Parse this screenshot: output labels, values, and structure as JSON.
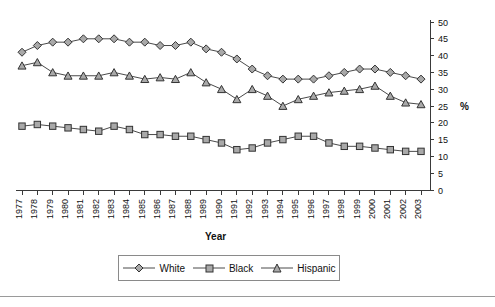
{
  "chart_data": {
    "type": "line",
    "title": "",
    "xlabel": "Year",
    "ylabel": "%",
    "ylim": [
      0,
      50
    ],
    "yticks": [
      0,
      5,
      10,
      15,
      20,
      25,
      30,
      35,
      40,
      45,
      50
    ],
    "grid": false,
    "legend_position": "bottom",
    "categories": [
      "1977",
      "1978",
      "1979",
      "1980",
      "1981",
      "1982",
      "1983",
      "1984",
      "1985",
      "1986",
      "1987",
      "1988",
      "1989",
      "1990",
      "1991",
      "1992",
      "1993",
      "1994",
      "1995",
      "1996",
      "1997",
      "1998",
      "1999",
      "2000",
      "2001",
      "2002",
      "2003"
    ],
    "series": [
      {
        "name": "White",
        "marker": "diamond",
        "color": "#a9a9a9",
        "values": [
          41,
          43,
          44,
          44,
          45,
          45,
          45,
          44,
          44,
          43,
          43,
          44,
          42,
          41,
          39,
          36,
          34,
          33,
          33,
          33,
          34,
          35,
          36,
          36,
          35,
          34,
          33
        ]
      },
      {
        "name": "Black",
        "marker": "square",
        "color": "#a9a9a9",
        "values": [
          19,
          19.5,
          19,
          18.5,
          18,
          17.5,
          19,
          18,
          16.5,
          16.5,
          16,
          16,
          15,
          14,
          12,
          12.5,
          14,
          15,
          16,
          16,
          14,
          13,
          13,
          12.5,
          12,
          11.5,
          11.5
        ]
      },
      {
        "name": "Hispanic",
        "marker": "triangle",
        "color": "#a9a9a9",
        "values": [
          37,
          38,
          35,
          34,
          34,
          34,
          35,
          34,
          33,
          33.5,
          33,
          35,
          32,
          30,
          27,
          30,
          28,
          25,
          27,
          28,
          29,
          29.5,
          30,
          31,
          28,
          26,
          25.5
        ]
      }
    ]
  },
  "axis": {
    "y_unit_label": "%",
    "x_title": "Year"
  },
  "legend": {
    "items": [
      {
        "label": "White",
        "marker": "diamond-marker"
      },
      {
        "label": "Black",
        "marker": "square-marker"
      },
      {
        "label": "Hispanic",
        "marker": "triangle-marker"
      }
    ]
  }
}
